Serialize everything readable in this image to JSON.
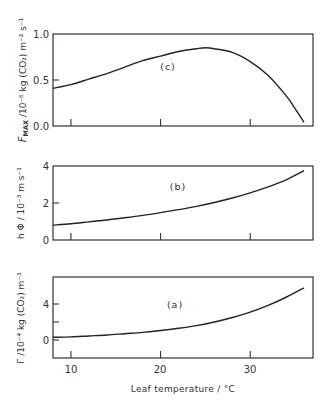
{
  "chart_data": [
    {
      "type": "line",
      "panel": "(c)",
      "ylabel": "F_MAX / 10^-6 kg (CO2) m^-2 s^-1",
      "xlabel": "Leaf temperature / °C",
      "xlim": [
        8,
        37
      ],
      "ylim": [
        0.0,
        1.0
      ],
      "yticks": [
        "0.0",
        "0.5",
        "1.0"
      ],
      "x": [
        8,
        10,
        12,
        14,
        16,
        18,
        20,
        22,
        24,
        25,
        26,
        28,
        30,
        32,
        34,
        35,
        36
      ],
      "y": [
        0.41,
        0.45,
        0.51,
        0.57,
        0.64,
        0.71,
        0.76,
        0.81,
        0.84,
        0.85,
        0.84,
        0.8,
        0.7,
        0.55,
        0.33,
        0.19,
        0.04
      ]
    },
    {
      "type": "line",
      "panel": "(b)",
      "ylabel": "h Φ / 10^-3 m s^-1",
      "xlabel": "Leaf temperature / °C",
      "xlim": [
        8,
        37
      ],
      "ylim": [
        0,
        4
      ],
      "yticks": [
        "0",
        "2",
        "4"
      ],
      "x": [
        8,
        10,
        12,
        14,
        16,
        18,
        20,
        22,
        24,
        26,
        28,
        30,
        32,
        34,
        36
      ],
      "y": [
        0.8,
        0.88,
        0.98,
        1.08,
        1.2,
        1.33,
        1.48,
        1.64,
        1.82,
        2.03,
        2.27,
        2.55,
        2.87,
        3.25,
        3.75
      ]
    },
    {
      "type": "line",
      "panel": "(a)",
      "ylabel": "Γ / 10^-4 kg (CO2) m^-3",
      "xlabel": "Leaf temperature / °C",
      "xlim": [
        8,
        37
      ],
      "ylim": [
        -2,
        7
      ],
      "yticks": [
        "0",
        "4"
      ],
      "xticks": [
        "10",
        "20",
        "30"
      ],
      "x": [
        8,
        10,
        12,
        14,
        16,
        18,
        20,
        22,
        24,
        26,
        28,
        30,
        32,
        34,
        36
      ],
      "y": [
        0.3,
        0.35,
        0.45,
        0.55,
        0.7,
        0.85,
        1.05,
        1.3,
        1.6,
        2.0,
        2.5,
        3.1,
        3.85,
        4.75,
        5.8
      ]
    }
  ],
  "labels": {
    "panel_c": "(c)",
    "panel_b": "(b)",
    "panel_a": "(a)",
    "ylabel_c_main": "F",
    "ylabel_c_sub": "MAX",
    "ylabel_c_rest": " /10⁻⁶ kg (CO₂) m⁻² s⁻¹",
    "ylabel_b": "h Φ / 10⁻³ m s⁻¹",
    "ylabel_a": "Γ /10⁻⁴ kg (CO₂) m⁻³",
    "xlabel": "Leaf temperature / °C",
    "c_ticks": [
      "0.0",
      "0.5",
      "1.0"
    ],
    "b_ticks": [
      "0",
      "2",
      "4"
    ],
    "a_ticks": [
      "0",
      "4"
    ],
    "x_ticks": [
      "10",
      "20",
      "30"
    ]
  }
}
